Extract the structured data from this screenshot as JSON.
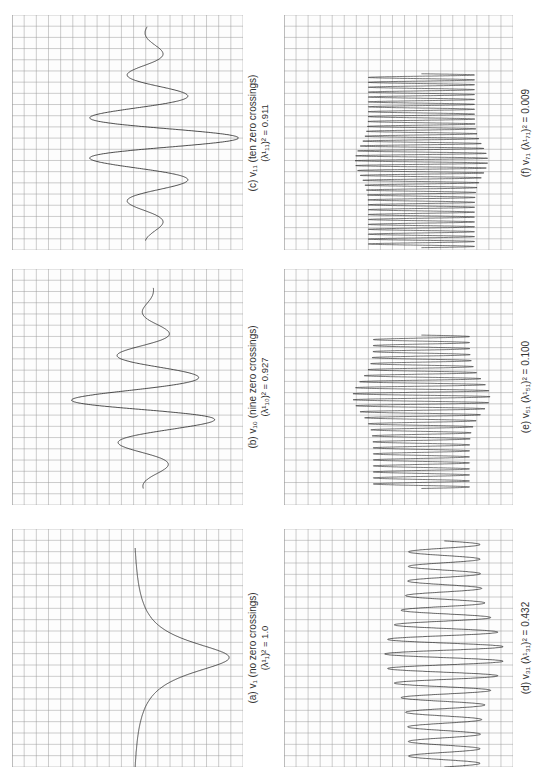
{
  "figure": {
    "layout": "3 rows x 2 columns, rotated 90 degrees counter-clockwise; captions to the right of each plot",
    "grid_color": "#9a9a9a",
    "curve_color": "#222222"
  },
  "panels": [
    {
      "id": "c",
      "caption": "(c)  v₁₁  (ten zero crossings)",
      "sub": "(λ¹₁₁)² = 0.911",
      "zero_crossings": 10,
      "lambda_sq": 0.911
    },
    {
      "id": "f",
      "caption": "(f)  v₇₁  (λ¹₇₁)² = 0.009",
      "sub": "",
      "lambda_sq": 0.009
    },
    {
      "id": "b",
      "caption": "(b)  v₁₀  (nine zero crossings)",
      "sub": "(λ¹₁₀)² = 0.927",
      "zero_crossings": 9,
      "lambda_sq": 0.927
    },
    {
      "id": "e",
      "caption": "(e)  v₅₁  (λ¹₅₁)² = 0.100",
      "sub": "",
      "lambda_sq": 0.1
    },
    {
      "id": "a",
      "caption": "(a)  v₁  (no zero crossings)",
      "sub": "(λ¹₁)² = 1.0",
      "zero_crossings": 0,
      "lambda_sq": 1.0
    },
    {
      "id": "d",
      "caption": "(d)  v₃₁  (λ¹₃₁)² = 0.432",
      "sub": "",
      "lambda_sq": 0.432
    }
  ],
  "chart_data": [
    {
      "type": "line",
      "title": "(a) v1 (no zero crossings)",
      "subtitle": "(lambda_1)^2 = 1.0",
      "description": "single peaked eigenfunction, no zero crossings",
      "zero_crossings": 0,
      "eigenvalue_sq": 1.0,
      "grid": true
    },
    {
      "type": "line",
      "title": "(b) v10 (nine zero crossings)",
      "subtitle": "(lambda_10)^2 = 0.927",
      "description": "oscillatory eigenfunction with nine zero crossings",
      "zero_crossings": 9,
      "eigenvalue_sq": 0.927,
      "grid": true
    },
    {
      "type": "line",
      "title": "(c) v11 (ten zero crossings)",
      "subtitle": "(lambda_11)^2 = 0.911",
      "description": "oscillatory eigenfunction with ten zero crossings",
      "zero_crossings": 10,
      "eigenvalue_sq": 0.911,
      "grid": true
    },
    {
      "type": "line",
      "title": "(d) v31",
      "subtitle": "(lambda_31)^2 = 0.432",
      "description": "high frequency oscillation, dense in center",
      "eigenvalue_sq": 0.432,
      "grid": true
    },
    {
      "type": "line",
      "title": "(e) v51",
      "subtitle": "(lambda_51)^2 = 0.100",
      "description": "very high frequency oscillation",
      "eigenvalue_sq": 0.1,
      "grid": true
    },
    {
      "type": "line",
      "title": "(f) v71",
      "subtitle": "(lambda_71)^2 = 0.009",
      "description": "very high frequency oscillation with central node",
      "eigenvalue_sq": 0.009,
      "grid": true
    }
  ]
}
